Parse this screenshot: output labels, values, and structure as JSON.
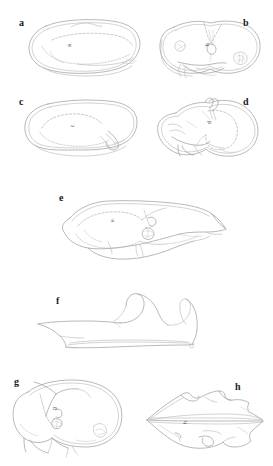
{
  "figure": {
    "type": "multi-panel-line-drawing-plate",
    "background_color": "#ffffff",
    "ink_color": "#9a9a9a",
    "label_color": "#1a1a1a",
    "width_px": 273,
    "height_px": 466,
    "panel_count": 8,
    "caption": ""
  },
  "panels": [
    {
      "id": "a",
      "label": "a",
      "label_position": "top-left",
      "label_x": 19,
      "label_y": 18,
      "row": 1,
      "column": 1,
      "description": "rounded elongate outline, dorsal view, double contour with faint interior dashed margin",
      "scale_mark": "a",
      "scale_mark_x": 67,
      "scale_mark_y": 47
    },
    {
      "id": "b",
      "label": "b",
      "label_position": "top-right",
      "label_x": 243,
      "label_y": 18,
      "row": 1,
      "column": 2,
      "description": "bilobed outline with median notch, two small circular structures and one granulate patch",
      "scale_mark": "b",
      "scale_mark_x": 205,
      "scale_mark_y": 46
    },
    {
      "id": "c",
      "label": "c",
      "label_position": "top-left",
      "label_x": 19,
      "label_y": 97,
      "row": 2,
      "column": 1,
      "description": "rounded elongate outline with ventral projection on right side, interior dashed line",
      "scale_mark": "c",
      "scale_mark_x": 70,
      "scale_mark_y": 127
    },
    {
      "id": "d",
      "label": "d",
      "label_position": "top-right",
      "label_x": 243,
      "label_y": 97,
      "row": 2,
      "column": 2,
      "description": "lateral view with paired apical spines and ventral lobes, dashed internal outline",
      "scale_mark": "d",
      "scale_mark_x": 207,
      "scale_mark_y": 124
    },
    {
      "id": "e",
      "label": "e",
      "label_position": "top-left",
      "label_x": 59,
      "label_y": 193,
      "row": 3,
      "column": 1,
      "description": "large elongate lateral outline with pointed posterior process and granulate patch",
      "scale_mark": "e",
      "scale_mark_x": 110,
      "scale_mark_y": 222
    },
    {
      "id": "f",
      "label": "f",
      "label_position": "top-left",
      "label_x": 56,
      "label_y": 296,
      "row": 4,
      "column": 1,
      "description": "slender lateral profile with two recurved hooked processes and a narrow basal blade",
      "scale_mark": "",
      "scale_mark_x": 0,
      "scale_mark_y": 0
    },
    {
      "id": "g",
      "label": "g",
      "label_position": "top-left",
      "label_x": 14,
      "label_y": 377,
      "row": 5,
      "column": 1,
      "description": "subcircular outline with ventral emarginations and paired basal lobes",
      "scale_mark": "g",
      "scale_mark_x": 52,
      "scale_mark_y": 410
    },
    {
      "id": "h",
      "label": "h",
      "label_position": "top-right",
      "label_x": 235,
      "label_y": 382,
      "row": 5,
      "column": 2,
      "description": "elongate rhomboid outline with acute anterior apex and longitudinal median carina",
      "scale_mark": "h",
      "scale_mark_x": 183,
      "scale_mark_y": 424
    }
  ]
}
